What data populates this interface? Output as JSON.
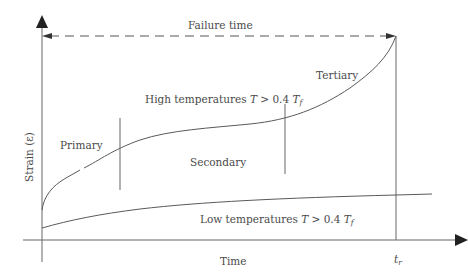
{
  "diagram": {
    "axes": {
      "x_label": "Time",
      "y_label": "Strain (ε)",
      "x_marker": {
        "symbol": "t",
        "subscript": "r"
      }
    },
    "failure_line": {
      "label": "Failure time",
      "style": "dashed"
    },
    "curves": [
      {
        "name": "high-temperature-creep",
        "label": "High temperatures T > 0.4 T",
        "label_parts": {
          "prefix": "High temperatures ",
          "var": "T",
          "op": " > 0.4 ",
          "var2": "T",
          "sub": "f"
        },
        "stages": [
          "Primary",
          "Secondary",
          "Tertiary"
        ]
      },
      {
        "name": "low-temperature-creep",
        "label": "Low temperatures T > 0.4 T",
        "label_parts": {
          "prefix": "Low temperatures ",
          "var": "T",
          "op": " > 0.4 ",
          "var2": "T",
          "sub": "f"
        }
      }
    ],
    "stage_labels": {
      "primary": "Primary",
      "secondary": "Secondary",
      "tertiary": "Tertiary"
    },
    "colors": {
      "line": "#5a5a5a",
      "axis": "#555555",
      "arrow": "#222222",
      "text": "#4a4a4a",
      "background": "#ffffff"
    }
  }
}
